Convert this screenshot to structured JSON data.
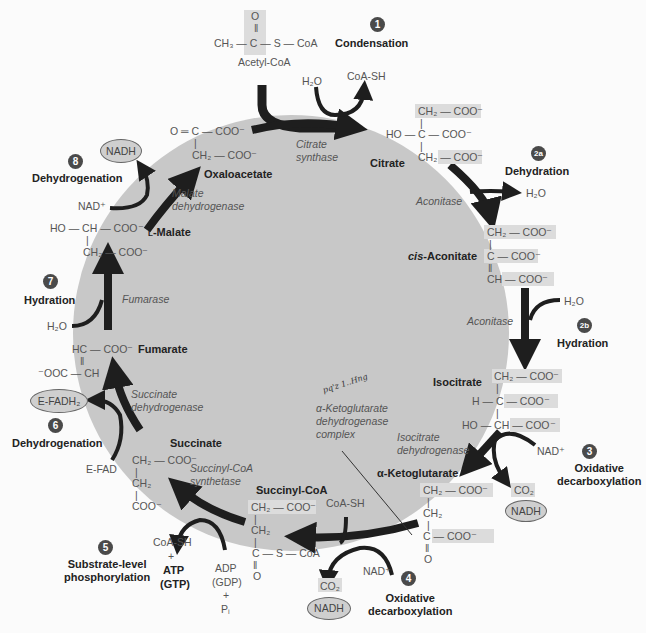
{
  "colors": {
    "circle_fill": "#c8c8c8",
    "arrow": "#1e1e1e",
    "highlight": "#dcdcdc",
    "badge": "#4a4a4a",
    "oval": "#cfcfcf"
  },
  "acetyl_coa": {
    "o": "O",
    "line": "CH₃ — C — S — CoA",
    "name": "Acetyl-CoA"
  },
  "steps": [
    {
      "num": "1",
      "label": "Condensation"
    },
    {
      "num": "2a",
      "label": "Dehydration"
    },
    {
      "num": "2b",
      "label": "Hydration"
    },
    {
      "num": "3",
      "label": "Oxidative decarboxylation",
      "l1": "Oxidative",
      "l2": "decarboxylation"
    },
    {
      "num": "4",
      "label": "Oxidative decarboxylation",
      "l1": "Oxidative",
      "l2": "decarboxylation"
    },
    {
      "num": "5",
      "label": "Substrate-level phosphorylation",
      "l1": "Substrate-level",
      "l2": "phosphorylation"
    },
    {
      "num": "6",
      "label": "Dehydrogenation"
    },
    {
      "num": "7",
      "label": "Hydration"
    },
    {
      "num": "8",
      "label": "Dehydrogenation"
    }
  ],
  "molecules": {
    "citrate": {
      "name": "Citrate",
      "r1": "CH₂ — COO⁻",
      "r2": "HO — C — COO⁻",
      "r3": "CH₂ — COO⁻"
    },
    "cis_aconitate": {
      "name_prefix": "cis",
      "name": "-Aconitate",
      "r1": "CH₂ — COO⁻",
      "r2": "C — COO⁻",
      "r3": "CH — COO⁻"
    },
    "isocitrate": {
      "name": "Isocitrate",
      "r1": "CH₂ — COO⁻",
      "r2": "H — C — COO⁻",
      "r3": "HO — CH — COO⁻"
    },
    "alpha_ketoglutarate": {
      "name": "α-Ketoglutarate",
      "r1": "CH₂ — COO⁻",
      "r2": "CH₂",
      "r3": "C — COO⁻",
      "r4": "O"
    },
    "succinyl_coa": {
      "name": "Succinyl-CoA",
      "r1": "CH₂ — COO⁻",
      "r2": "CH₂",
      "r3": "C — S — CoA",
      "r4": "O"
    },
    "succinate": {
      "name": "Succinate",
      "r1": "CH₂ — COO⁻",
      "r2": "CH₂",
      "r3": "COO⁻"
    },
    "fumarate": {
      "name": "Fumarate",
      "r1": "HC — COO⁻",
      "r2": "⁻OOC — CH"
    },
    "malate": {
      "name": "L-Malate",
      "prefix": "L",
      "rest": "-Malate",
      "r1": "HO — CH — COO⁻",
      "r2": "CH₂ — COO⁻"
    },
    "oxaloacetate": {
      "name": "Oxaloacetate",
      "r1": "O ═ C — COO⁻",
      "r2": "CH₂ — COO⁻"
    }
  },
  "enzymes": {
    "citrate_synthase": [
      "Citrate",
      "synthase"
    ],
    "aconitase_1": [
      "Aconitase"
    ],
    "aconitase_2": [
      "Aconitase"
    ],
    "isocitrate_dh": [
      "Isocitrate",
      "dehydrogenase"
    ],
    "akg_dh": [
      "α-Ketoglutarate",
      "dehydrogenase",
      "complex"
    ],
    "succinyl_coa_synthetase": [
      "Succinyl-CoA",
      "synthetase"
    ],
    "succinate_dh": [
      "Succinate",
      "dehydrogenase"
    ],
    "fumarase": [
      "Fumarase"
    ],
    "malate_dh": [
      "Malate",
      "dehydrogenase"
    ]
  },
  "cofactors": {
    "h2o_1": "H₂O",
    "coa_sh_1": "CoA-SH",
    "h2o_2a": "H₂O",
    "h2o_2b": "H₂O",
    "nad_3": "NAD⁺",
    "co2_3": "CO₂",
    "nadh_3": "NADH",
    "coa_sh_4": "CoA-SH",
    "nad_4": "NAD⁺",
    "co2_4": "CO₂",
    "nadh_4": "NADH",
    "coa_sh_5": "CoA-SH",
    "plus_5": "+",
    "atp": "ATP",
    "gtp": "(GTP)",
    "adp": "ADP",
    "gdp": "(GDP)",
    "plus_5b": "+",
    "pi": "Pᵢ",
    "fadh2": "E-FADH₂",
    "fad": "E-FAD",
    "h2o_7": "H₂O",
    "nad_8": "NAD⁺",
    "nadh_8": "NADH"
  },
  "handwritten_note": "pq'z 1..Hng"
}
